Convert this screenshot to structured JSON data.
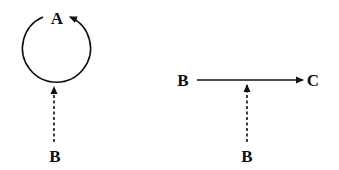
{
  "diagram": {
    "left_panel": {
      "loop_node": {
        "label": "A",
        "edge": "self-loop",
        "arrow_direction": "counter-clockwise"
      },
      "modifier_node": {
        "label": "B",
        "edge_style": "dashed",
        "target": "self-loop"
      }
    },
    "right_panel": {
      "source_node": {
        "label": "B"
      },
      "target_node": {
        "label": "C"
      },
      "edge_style": "solid",
      "modifier_node": {
        "label": "B",
        "edge_style": "dashed",
        "target": "B-to-C edge"
      }
    },
    "colors": {
      "stroke": "#111111",
      "background": "#ffffff"
    }
  }
}
